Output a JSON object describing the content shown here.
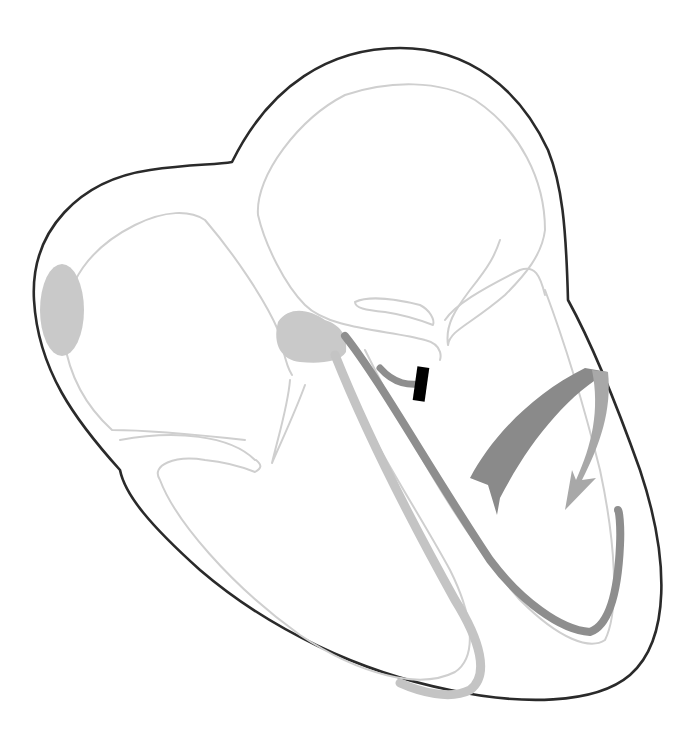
{
  "diagram": {
    "colors": {
      "outline": "#2a2a2a",
      "chamber_lines": "#cfcfcf",
      "node_fill": "#c9c9c9",
      "light_bundle": "#c4c4c4",
      "dark_bundle": "#8e8e8e",
      "arrow_dark": "#8a8a8a",
      "arrow_light": "#a8a8a8",
      "marker": "#000000",
      "background": "#ffffff"
    },
    "elements": [
      {
        "name": "heart-outline",
        "description": "Outer contour of the heart"
      },
      {
        "name": "right-atrium",
        "description": "Upper-left chamber outline"
      },
      {
        "name": "left-atrium",
        "description": "Upper-middle chamber outline"
      },
      {
        "name": "right-ventricle",
        "description": "Lower-left chamber outline"
      },
      {
        "name": "left-ventricle",
        "description": "Lower-right chamber outline"
      },
      {
        "name": "sa-node",
        "description": "Grey oval on left atrial wall"
      },
      {
        "name": "av-node",
        "description": "Grey blob at septum junction"
      },
      {
        "name": "right-bundle-branch",
        "description": "Light grey band along right ventricle"
      },
      {
        "name": "left-bundle-branch",
        "description": "Dark grey band along left ventricle"
      },
      {
        "name": "block-marker",
        "description": "Black bar across left bundle branch offshoot"
      },
      {
        "name": "curved-arrow",
        "description": "Dark grey curved arrow indicating impulse path"
      }
    ]
  }
}
